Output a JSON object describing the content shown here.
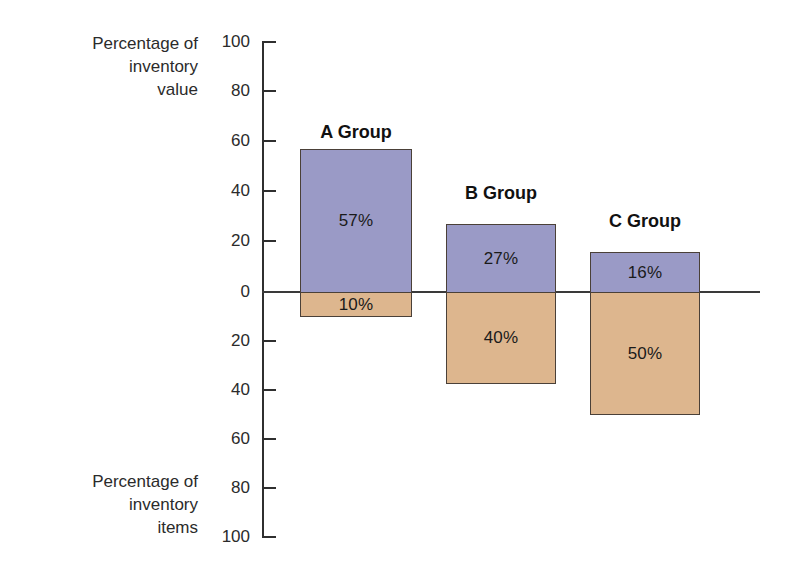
{
  "chart_data": {
    "type": "bar",
    "title": "",
    "subtitle": "",
    "orientation": "vertical-diverging",
    "categories": [
      "A Group",
      "B Group",
      "C Group"
    ],
    "series": [
      {
        "name": "Percentage of inventory value",
        "direction": "up",
        "color": "#9a9ac6",
        "values": [
          57,
          27,
          16
        ],
        "labels": [
          "57%",
          "27%",
          "16%"
        ]
      },
      {
        "name": "Percentage of inventory items",
        "direction": "down",
        "color": "#ddb68e",
        "values": [
          10,
          40,
          50
        ],
        "labels": [
          "10%",
          "40%",
          "50%"
        ]
      }
    ],
    "ylabel_top": "Percentage of\ninventory\nvalue",
    "ylabel_bottom": "Percentage of\ninventory\nitems",
    "xlabel": "",
    "ylim": [
      -100,
      100
    ],
    "y_ticks_top": [
      100,
      80,
      60,
      40,
      20,
      0
    ],
    "y_ticks_bottom": [
      20,
      40,
      60,
      80,
      100
    ],
    "tick_labels": [
      "100",
      "80",
      "60",
      "40",
      "20",
      "0",
      "20",
      "40",
      "60",
      "80",
      "100"
    ],
    "grid": false,
    "legend": "none",
    "baseline_value": 0
  },
  "axis": {
    "caption_top": "Percentage of\ninventory\nvalue",
    "caption_bottom": "Percentage of\ninventory\nitems",
    "ticks": [
      {
        "label": "100",
        "y": 42
      },
      {
        "label": "80",
        "y": 91
      },
      {
        "label": "60",
        "y": 141
      },
      {
        "label": "40",
        "y": 191
      },
      {
        "label": "20",
        "y": 241
      },
      {
        "label": "0",
        "y": 292
      },
      {
        "label": "20",
        "y": 341
      },
      {
        "label": "40",
        "y": 390
      },
      {
        "label": "60",
        "y": 439
      },
      {
        "label": "80",
        "y": 488
      },
      {
        "label": "100",
        "y": 537
      }
    ]
  },
  "bars": [
    {
      "name": "A Group",
      "title": "A Group",
      "x": 300,
      "width": 112,
      "title_y": 122,
      "upper": {
        "label": "57%",
        "top": 149,
        "height": 143
      },
      "lower": {
        "label": "10%",
        "top": 292,
        "height": 25
      }
    },
    {
      "name": "B Group",
      "title": "B Group",
      "x": 446,
      "width": 110,
      "title_y": 183,
      "upper": {
        "label": "27%",
        "top": 224,
        "height": 68
      },
      "lower": {
        "label": "40%",
        "top": 292,
        "height": 92
      }
    },
    {
      "name": "C Group",
      "title": "C Group",
      "x": 590,
      "width": 110,
      "title_y": 211,
      "upper": {
        "label": "16%",
        "top": 252,
        "height": 40
      },
      "lower": {
        "label": "50%",
        "top": 292,
        "height": 123
      }
    }
  ],
  "colors": {
    "value_series": "#9a9ac6",
    "items_series": "#ddb68e",
    "axis": "#2f2f2f",
    "text": "#1a1a1a",
    "background": "#ffffff"
  }
}
